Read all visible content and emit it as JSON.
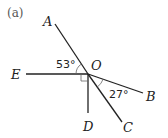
{
  "part_label": "(a)",
  "vertex": {
    "label": "O",
    "x": 88,
    "y": 74
  },
  "rays": [
    {
      "id": "OA",
      "label": "A",
      "end": [
        55,
        24
      ],
      "label_pos": [
        43,
        26
      ]
    },
    {
      "id": "OE",
      "label": "E",
      "end": [
        26,
        74
      ],
      "label_pos": [
        11,
        79
      ]
    },
    {
      "id": "OD",
      "label": "D",
      "end": [
        88,
        113
      ],
      "label_pos": [
        83,
        131
      ]
    },
    {
      "id": "OC",
      "label": "C",
      "end": [
        122,
        122
      ],
      "label_pos": [
        123,
        132
      ]
    },
    {
      "id": "OB",
      "label": "B",
      "end": [
        143,
        93
      ],
      "label_pos": [
        146,
        101
      ]
    }
  ],
  "angles": [
    {
      "id": "angle-AOE",
      "text": "53°",
      "label_pos": [
        56,
        68
      ]
    },
    {
      "id": "angle-BOC",
      "text": "27°",
      "label_pos": [
        109,
        98
      ]
    }
  ],
  "right_angle": {
    "between": [
      "OE",
      "OD"
    ],
    "size": 7
  }
}
